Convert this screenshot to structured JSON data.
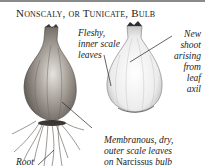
{
  "title": "Nonscaly, or Tunicate, Bulb",
  "labels": {
    "fleshy": [
      "Fleshy,",
      "inner scale",
      "leaves"
    ],
    "shoot": [
      "New",
      "shoot",
      "arising",
      "from",
      "leaf",
      "axil"
    ],
    "membranous": [
      "Membranous, dry,",
      "outer scale leaves"
    ],
    "membranous_last_prefix": "on ",
    "membranous_last_genus": "Narcissus",
    "membranous_last_suffix": " bulb",
    "root": "Root"
  },
  "colors": {
    "ink": "#222222",
    "rule": "#8a8a8a",
    "bulb_outer": "#8c8580",
    "bulb_inner": "#f2f2f2"
  }
}
